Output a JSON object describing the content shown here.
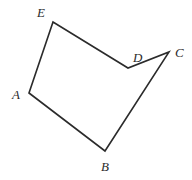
{
  "figure": {
    "kind": "polygon-diagram",
    "shape_name": "pentagon ABCDE",
    "width": 192,
    "height": 180,
    "background_color": "#ffffff",
    "stroke_color": "#2b2b2b",
    "stroke_width": 1.6,
    "label_color": "#2b2b2b",
    "vertices": [
      {
        "id": "A",
        "label": "A",
        "x": 29,
        "y": 93,
        "label_x": 12,
        "label_y": 88
      },
      {
        "id": "B",
        "label": "B",
        "x": 105,
        "y": 151,
        "label_x": 101,
        "label_y": 160
      },
      {
        "id": "C",
        "label": "C",
        "x": 169,
        "y": 52,
        "label_x": 175,
        "label_y": 46
      },
      {
        "id": "D",
        "label": "D",
        "x": 128,
        "y": 68,
        "label_x": 133,
        "label_y": 51
      },
      {
        "id": "E",
        "label": "E",
        "x": 53,
        "y": 22,
        "label_x": 37,
        "label_y": 6
      }
    ],
    "edges": [
      {
        "from": "A",
        "to": "B"
      },
      {
        "from": "B",
        "to": "C"
      },
      {
        "from": "C",
        "to": "D"
      },
      {
        "from": "D",
        "to": "E"
      },
      {
        "from": "E",
        "to": "A"
      }
    ],
    "path_d": "M 29 93 L 105 151 L 169 52 L 128 68 L 53 22 Z"
  }
}
